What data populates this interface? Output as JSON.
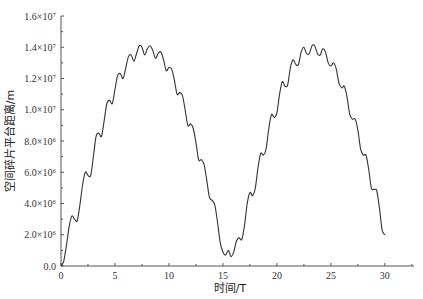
{
  "chart_data": {
    "type": "line",
    "title": "",
    "xlabel": "时间/T",
    "ylabel": "空间碎片平台距离/m",
    "xlim": [
      0,
      32.7
    ],
    "ylim": [
      0,
      16000000
    ],
    "grid": false,
    "legend": null,
    "x_ticks": [
      0,
      5,
      10,
      15,
      20,
      25,
      30
    ],
    "x_tick_labels": [
      "0",
      "5",
      "10",
      "15",
      "20",
      "25",
      "30"
    ],
    "y_ticks": [
      0,
      2000000,
      4000000,
      6000000,
      8000000,
      10000000,
      12000000,
      14000000,
      16000000
    ],
    "y_tick_labels": [
      "0.0",
      "2.0×10⁶",
      "4.0×10⁶",
      "6.0×10⁶",
      "8.0×10⁶",
      "1.0×10⁷",
      "1.2×10⁷",
      "1.4×10⁷",
      "1.6×10⁷"
    ],
    "series": [
      {
        "name": "distance",
        "color": "#333333",
        "x": [
          0,
          0.25,
          0.5,
          0.75,
          1.0,
          1.25,
          1.5,
          1.75,
          2.0,
          2.25,
          2.5,
          2.75,
          3.0,
          3.25,
          3.5,
          3.75,
          4.0,
          4.25,
          4.5,
          4.75,
          5.0,
          5.25,
          5.5,
          5.75,
          6.0,
          6.25,
          6.5,
          6.75,
          7.0,
          7.25,
          7.5,
          7.75,
          8.0,
          8.25,
          8.5,
          8.75,
          9.0,
          9.25,
          9.5,
          9.75,
          10.0,
          10.25,
          10.5,
          10.75,
          11.0,
          11.25,
          11.5,
          11.75,
          12.0,
          12.25,
          12.5,
          12.75,
          13.0,
          13.25,
          13.5,
          13.75,
          14.0,
          14.25,
          14.5,
          14.75,
          15.0,
          15.25,
          15.5,
          15.75,
          16.0,
          16.25,
          16.5,
          16.75,
          17.0,
          17.25,
          17.5,
          17.75,
          18.0,
          18.25,
          18.5,
          18.75,
          19.0,
          19.25,
          19.5,
          19.75,
          20.0,
          20.25,
          20.5,
          20.75,
          21.0,
          21.25,
          21.5,
          21.75,
          22.0,
          22.25,
          22.5,
          22.75,
          23.0,
          23.25,
          23.5,
          23.75,
          24.0,
          24.25,
          24.5,
          24.75,
          25.0,
          25.25,
          25.5,
          25.75,
          26.0,
          26.25,
          26.5,
          26.75,
          27.0,
          27.25,
          27.5,
          27.75,
          28.0,
          28.25,
          28.5,
          28.75,
          29.0,
          29.25,
          29.5,
          29.75,
          30.0
        ],
        "values": [
          0,
          300000,
          1300000,
          2500000,
          3200000,
          3000000,
          2900000,
          3900000,
          5200000,
          6000000,
          5800000,
          5800000,
          7000000,
          8300000,
          8500000,
          8300000,
          9300000,
          10400000,
          10600000,
          10400000,
          11300000,
          12200000,
          12300000,
          12000000,
          12700000,
          13400000,
          13500000,
          13100000,
          13600000,
          14100000,
          14000000,
          13500000,
          13900000,
          14100000,
          13800000,
          13300000,
          13600000,
          13700000,
          13200000,
          12500000,
          12700000,
          12600000,
          11900000,
          11000000,
          11100000,
          10900000,
          10000000,
          9000000,
          9100000,
          8800000,
          7900000,
          6800000,
          6800000,
          6500000,
          5500000,
          4400000,
          4200000,
          3900000,
          2800000,
          1500000,
          900000,
          700000,
          1000000,
          600000,
          900000,
          1600000,
          1800000,
          1700000,
          2600000,
          4000000,
          4700000,
          4500000,
          5000000,
          6300000,
          7200000,
          7100000,
          7500000,
          8800000,
          9700000,
          9500000,
          9800000,
          11000000,
          11800000,
          11500000,
          11600000,
          12700000,
          13200000,
          12900000,
          12900000,
          13700000,
          14000000,
          13600000,
          13600000,
          14100000,
          14100000,
          13600000,
          13500000,
          13900000,
          13700000,
          13000000,
          12800000,
          13000000,
          12600000,
          11700000,
          11400000,
          11500000,
          10800000,
          9700000,
          9400000,
          9400000,
          8700000,
          7500000,
          7100000,
          7100000,
          6200000,
          5000000,
          4900000,
          4800000,
          3700000,
          2300000,
          2000000
        ]
      }
    ]
  }
}
